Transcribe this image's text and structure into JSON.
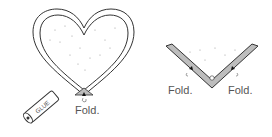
{
  "diagram": {
    "left_panel": {
      "subject": "heart-shaped frame",
      "fold_label": "Fold.",
      "glue_label": "GLUE"
    },
    "right_panel": {
      "subject": "folded corner detail",
      "fold_label_left": "Fold.",
      "fold_label_right": "Fold."
    },
    "colors": {
      "stroke": "#333333",
      "fold_fill": "#bdbdbd",
      "dots": "#9a9a9a"
    }
  }
}
